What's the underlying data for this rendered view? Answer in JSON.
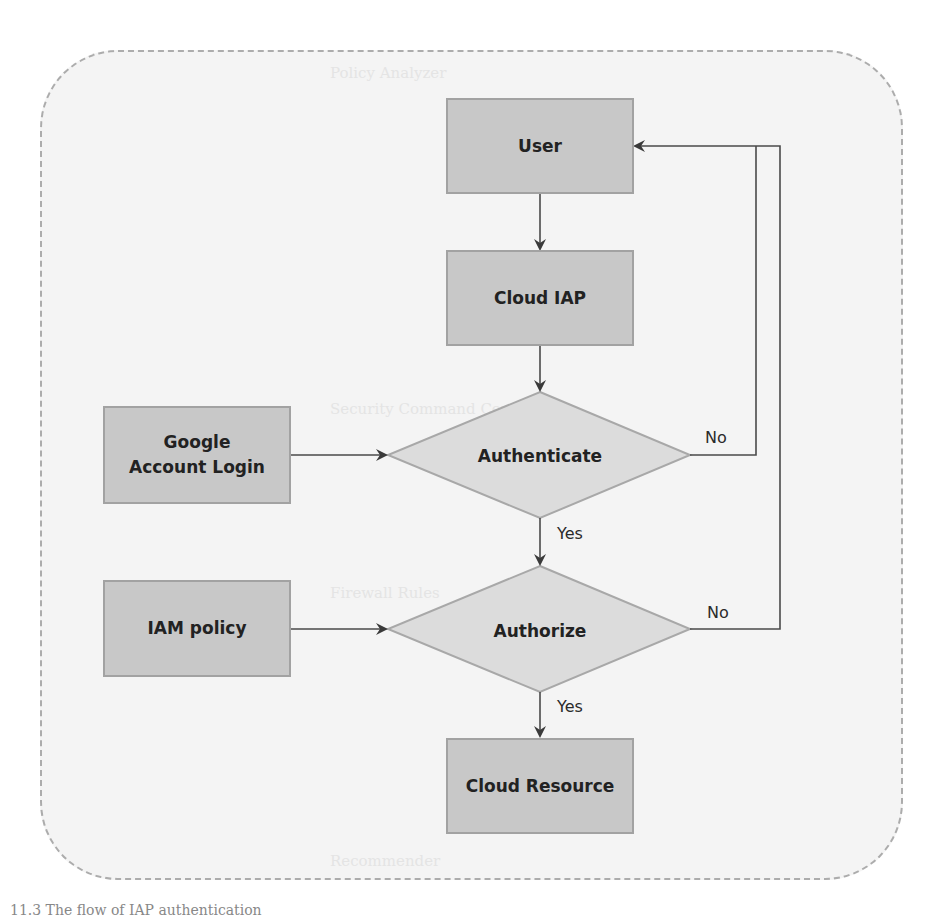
{
  "diagram": {
    "nodes": {
      "user": "User",
      "cloud_iap": "Cloud IAP",
      "google_login": "Google Account Login",
      "authenticate": "Authenticate",
      "iam_policy": "IAM policy",
      "authorize": "Authorize",
      "cloud_resource": "Cloud Resource"
    },
    "edges": {
      "auth_yes": "Yes",
      "auth_no": "No",
      "authz_yes": "Yes",
      "authz_no": "No"
    }
  },
  "background_text": [
    "Policy Analyzer",
    "Security Command Center",
    "Firewall Rules",
    "Recommender"
  ],
  "caption": "11.3 The flow of IAP authentication",
  "colors": {
    "box_fill": "#c8c8c8",
    "diamond_fill": "#dcdcdc",
    "container_fill": "#f4f4f4",
    "line": "#4a4a4a"
  }
}
